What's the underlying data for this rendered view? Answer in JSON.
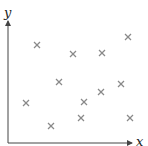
{
  "chart_data": {
    "type": "scatter",
    "title": "",
    "xlabel": "x",
    "ylabel": "y",
    "grid": false,
    "legend": null,
    "marker": "x",
    "marker_color": "#8a8a8a",
    "axis_color": "#444444",
    "axis_ticks": false,
    "xlim": [
      0,
      10
    ],
    "ylim": [
      0,
      10
    ],
    "points": [
      {
        "x": 2.3,
        "y": 8.0
      },
      {
        "x": 5.2,
        "y": 7.3
      },
      {
        "x": 7.5,
        "y": 7.4
      },
      {
        "x": 9.6,
        "y": 8.6
      },
      {
        "x": 4.1,
        "y": 5.1
      },
      {
        "x": 9.0,
        "y": 4.9
      },
      {
        "x": 7.4,
        "y": 4.3
      },
      {
        "x": 1.4,
        "y": 3.3
      },
      {
        "x": 6.0,
        "y": 3.4
      },
      {
        "x": 5.8,
        "y": 2.1
      },
      {
        "x": 9.8,
        "y": 2.1
      },
      {
        "x": 3.4,
        "y": 1.4
      }
    ]
  },
  "plot_area": {
    "origin_px": [
      8,
      143
    ],
    "x_end_px": 131,
    "y_end_px": 22,
    "pixel_points": [
      [
        37,
        45
      ],
      [
        73,
        54
      ],
      [
        102,
        53
      ],
      [
        128,
        37
      ],
      [
        59,
        82
      ],
      [
        121,
        84
      ],
      [
        101,
        92
      ],
      [
        26,
        103
      ],
      [
        84,
        102
      ],
      [
        81,
        118
      ],
      [
        130,
        118
      ],
      [
        51,
        126
      ]
    ]
  }
}
